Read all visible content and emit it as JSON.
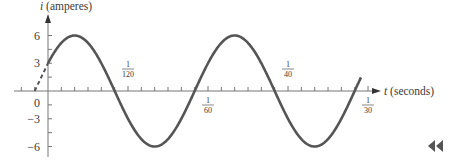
{
  "chart_data": {
    "type": "line",
    "title": "",
    "function": "i = 6 sin(120*pi*t + pi/6)",
    "xlabel_var": "t",
    "xlabel_unit": "(seconds)",
    "ylabel_var": "i",
    "ylabel_unit": "(amperes)",
    "y_ticks": [
      {
        "value": 6,
        "label": "6"
      },
      {
        "value": 3,
        "label": "3"
      },
      {
        "value": 0,
        "label": "0"
      },
      {
        "value": -3,
        "label": "−3"
      },
      {
        "value": -6,
        "label": "−6"
      }
    ],
    "x_labeled_ticks": [
      {
        "value": 0.008333,
        "num": "1",
        "den": "120",
        "position": "above"
      },
      {
        "value": 0.016667,
        "num": "1",
        "den": "60",
        "position": "below"
      },
      {
        "value": 0.025,
        "num": "1",
        "den": "40",
        "position": "above"
      },
      {
        "value": 0.033333,
        "num": "1",
        "den": "30",
        "position": "below"
      }
    ],
    "x_minor_tick_step": 0.001389,
    "xlim": [
      -0.0035,
      0.0345
    ],
    "ylim": [
      -6.5,
      7
    ],
    "series": [
      {
        "name": "i(t)",
        "style": "solid",
        "color": "#555555",
        "t_range": [
          0,
          0.0326
        ],
        "amplitude": 6,
        "angular_frequency": 376.99,
        "phase": 0.5236
      },
      {
        "name": "extension",
        "style": "dashed",
        "color": "#555555",
        "t_range": [
          -0.001389,
          0
        ]
      }
    ],
    "key_points": [
      {
        "t": 0,
        "i": 3
      },
      {
        "t": -0.001389,
        "i": 0
      },
      {
        "t": 0.002778,
        "i": 6
      },
      {
        "t": 0.006944,
        "i": 0
      },
      {
        "t": 0.011111,
        "i": -6
      },
      {
        "t": 0.015278,
        "i": 0
      },
      {
        "t": 0.019444,
        "i": 6
      },
      {
        "t": 0.023611,
        "i": 0
      },
      {
        "t": 0.027778,
        "i": -6
      },
      {
        "t": 0.031944,
        "i": 0
      }
    ],
    "grid": false,
    "legend": "none"
  },
  "nav": {
    "back_icon": "◀◀"
  }
}
